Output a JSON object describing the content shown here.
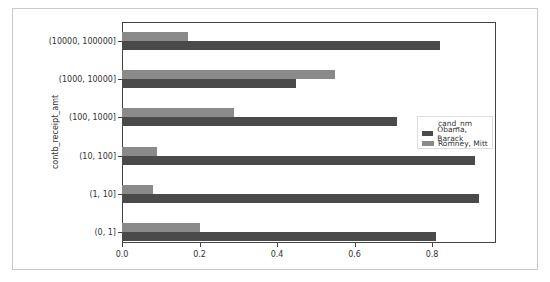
{
  "chart_data": {
    "type": "bar",
    "orientation": "horizontal",
    "title": "",
    "xlabel": "",
    "ylabel": "contb_receipt_amt",
    "xlim": [
      0,
      0.95
    ],
    "xticks": [
      "0.0",
      "0.2",
      "0.4",
      "0.6",
      "0.8"
    ],
    "grid": false,
    "legend_position": "center right",
    "legend_title": "cand_nm",
    "categories": [
      "(0, 1]",
      "(1, 10]",
      "(10, 100]",
      "(100, 1000]",
      "(1000, 10000]",
      "(10000, 100000]"
    ],
    "series": [
      {
        "name": "Obama, Barack",
        "color": "#4a4a4a",
        "values": [
          0.81,
          0.92,
          0.91,
          0.71,
          0.45,
          0.82
        ]
      },
      {
        "name": "Romney, Mitt",
        "color": "#8a8a8a",
        "values": [
          0.2,
          0.08,
          0.09,
          0.29,
          0.55,
          0.17
        ]
      }
    ]
  }
}
